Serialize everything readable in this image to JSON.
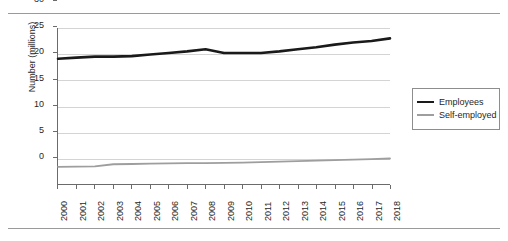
{
  "chart_data": {
    "type": "line",
    "title": "",
    "xlabel": "",
    "ylabel": "Number (millions)",
    "xlim": [
      2000,
      2018
    ],
    "ylim": [
      0,
      30
    ],
    "yticks": [
      0,
      5,
      10,
      15,
      20,
      25,
      30
    ],
    "grid": true,
    "legend_position": "right",
    "categories": [
      "2000",
      "2001",
      "2002",
      "2003",
      "2004",
      "2005",
      "2006",
      "2007",
      "2008",
      "2009",
      "2010",
      "2011",
      "2012",
      "2013",
      "2014",
      "2015",
      "2016",
      "2017",
      "2018"
    ],
    "series": [
      {
        "name": "Employees",
        "color": "#1a1a1a",
        "values": [
          24.1,
          24.3,
          24.5,
          24.5,
          24.6,
          24.9,
          25.2,
          25.5,
          25.9,
          25.2,
          25.2,
          25.2,
          25.5,
          25.9,
          26.3,
          26.8,
          27.2,
          27.5,
          28.0
        ]
      },
      {
        "name": "Self-employed",
        "color": "#9e9e9e",
        "values": [
          3.3,
          3.35,
          3.4,
          3.8,
          3.85,
          3.9,
          3.95,
          4.0,
          4.0,
          4.05,
          4.1,
          4.2,
          4.3,
          4.4,
          4.5,
          4.6,
          4.7,
          4.8,
          4.9
        ]
      }
    ]
  },
  "legend": {
    "items": [
      {
        "label": "Employees"
      },
      {
        "label": "Self-employed"
      }
    ]
  }
}
